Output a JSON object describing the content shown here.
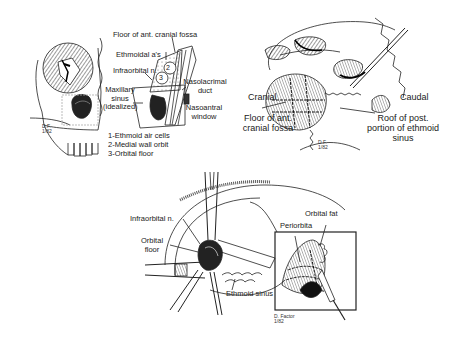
{
  "panels": [
    {
      "id": "top-left",
      "labels": {
        "floor_ant_cranial_fossa": "Floor of ant. cranial fossa",
        "ethmoidal_as": "Ethmoidal a's",
        "infraorbital_n": "Infraorbital n.",
        "maxillary_sinus": [
          "Maxillary",
          "sinus",
          "(idealized)"
        ],
        "nasolacrimal_duct": [
          "Nasolacrimal",
          "duct"
        ],
        "nasoantral_window": [
          "Nasoantral",
          "window"
        ],
        "region_numbers": [
          "1",
          "2",
          "3"
        ]
      },
      "legend": [
        "1-Ethmoid air cells",
        "2-Medial wall orbit",
        "3-Orbital floor"
      ],
      "signature": [
        "D.F.",
        "1/82"
      ]
    },
    {
      "id": "top-right",
      "labels": {
        "cranial": "Cranial",
        "caudal": "Caudal",
        "floor_ant_cranial_fossa": [
          "Floor of ant.",
          "cranial fossa"
        ],
        "roof_post_ethmoid": [
          "Roof of post.",
          "portion of ethmoid",
          "sinus"
        ]
      },
      "signature": [
        "D.F.",
        "1/82"
      ]
    },
    {
      "id": "bottom",
      "labels": {
        "infraorbital_n": "Infraorbital n.",
        "orbital_floor": [
          "Orbital",
          "floor"
        ],
        "ethmoid_sinus": "Ethmoid sinus",
        "periorbita": "Periorbita",
        "orbital_fat": "Orbital fat"
      },
      "signature": [
        "D. Factor",
        "1/82"
      ]
    }
  ]
}
